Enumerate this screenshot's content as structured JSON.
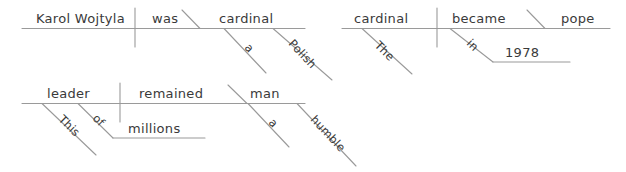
{
  "canvas": {
    "width": 626,
    "height": 172,
    "background": "#ffffff",
    "line_color": "#9a9a9a",
    "text_color": "#3a3a3a"
  },
  "diagrams": [
    {
      "id": "diagram-1",
      "sentence": "Karol Wojtyla was a Polish cardinal.",
      "words": {
        "subject": "Karol Wojtyla",
        "verb": "was",
        "complement": "cardinal",
        "article": "a",
        "adjective": "Polish"
      }
    },
    {
      "id": "diagram-2",
      "sentence": "The cardinal became pope in 1978.",
      "words": {
        "subject": "cardinal",
        "article": "The",
        "verb": "became",
        "complement": "pope",
        "preposition": "in",
        "object_of_preposition": "1978"
      }
    },
    {
      "id": "diagram-3",
      "sentence": "This leader of millions remained a humble man.",
      "words": {
        "subject": "leader",
        "determiner": "This",
        "preposition": "of",
        "object_of_preposition": "millions",
        "verb": "remained",
        "complement": "man",
        "article": "a",
        "adjective": "humble"
      }
    }
  ],
  "labels": {
    "d1_subject": "Karol Wojtyla",
    "d1_verb": "was",
    "d1_complement": "cardinal",
    "d1_article": "a",
    "d1_adjective": "Polish",
    "d2_subject": "cardinal",
    "d2_article": "The",
    "d2_verb": "became",
    "d2_complement": "pope",
    "d2_preposition": "in",
    "d2_pobject": "1978",
    "d3_subject": "leader",
    "d3_determiner": "This",
    "d3_preposition": "of",
    "d3_pobject": "millions",
    "d3_verb": "remained",
    "d3_complement": "man",
    "d3_article": "a",
    "d3_adjective": "humble"
  }
}
